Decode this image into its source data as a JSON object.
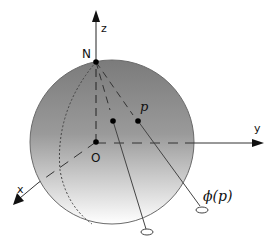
{
  "diagram": {
    "labels": {
      "north_pole": "N",
      "origin": "O",
      "x_axis": "x",
      "y_axis": "y",
      "z_axis": "z",
      "point": "p",
      "projection": "ϕ(p)"
    },
    "colors": {
      "sphere_top": "#7a7a7a",
      "sphere_bottom": "#ffffff",
      "stroke": "#333333",
      "dot": "#000000"
    }
  }
}
